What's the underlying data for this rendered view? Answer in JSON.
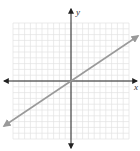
{
  "chart_data": {
    "type": "line",
    "title": "",
    "xlabel": "x",
    "ylabel": "y",
    "xlim": [
      -10,
      10
    ],
    "ylim": [
      -10,
      10
    ],
    "grid": true,
    "legend": null,
    "series": [
      {
        "name": "line",
        "equation": "y = (2/3)x",
        "x": [
          -11.5,
          0,
          11.5
        ],
        "y": [
          -7.7,
          0,
          7.7
        ],
        "color": "#999999",
        "arrows": "both"
      }
    ]
  },
  "colors": {
    "grid": "#e2e2e2",
    "axis": "#222222",
    "line": "#9a9a9a"
  },
  "labels": {
    "x_axis": "x",
    "y_axis": "y"
  }
}
